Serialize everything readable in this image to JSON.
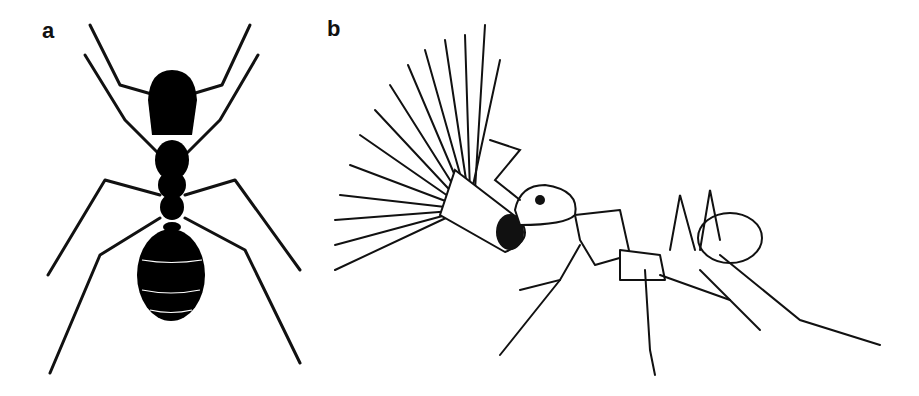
{
  "figure": {
    "panels": [
      {
        "label": "a",
        "subject": "ant-dorsal-view",
        "fill": "#000000"
      },
      {
        "label": "b",
        "subject": "leafcutter-ant-carrying-flower",
        "fill": "#ffffff"
      }
    ],
    "background": "#ffffff",
    "ink_color": "#111111"
  }
}
